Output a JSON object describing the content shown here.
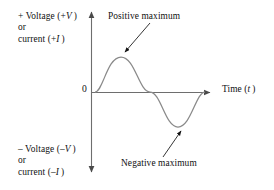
{
  "figure": {
    "type": "line-plot-sine-wave",
    "width": 274,
    "height": 190,
    "background_color": "#ffffff",
    "curve_color": "#8a8a8a",
    "axis_color": "#6e6e6e",
    "text_color": "#111111"
  },
  "axes": {
    "vertical": {
      "positive_label_line1": "+ Voltage (+V)",
      "positive_label_line2": "or",
      "positive_label_line3": "current (+I)",
      "negative_label_line1": "– Voltage (–V)",
      "negative_label_line2": "or",
      "negative_label_line3": "current (–I)",
      "arrow_up": true,
      "arrow_down": true
    },
    "horizontal": {
      "label": "Time (t)",
      "label_text": "Time",
      "label_symbol": "t",
      "arrow_right": true
    },
    "origin_label": "0"
  },
  "annotations": [
    {
      "id": "positive-maximum",
      "text": "Positive maximum",
      "target_x": 121,
      "target_y": 56
    },
    {
      "id": "negative-maximum",
      "text": "Negative maximum",
      "target_x": 178,
      "target_y": 127
    }
  ],
  "chart_data": {
    "type": "line",
    "title": "",
    "xlabel": "Time (t)",
    "ylabel": "+ Voltage (+V) or current (+I)",
    "grid": false,
    "legend": "none",
    "x": [
      0,
      0.125,
      0.25,
      0.375,
      0.5,
      0.625,
      0.75,
      0.875,
      1
    ],
    "series": [
      {
        "name": "Sinusoidal waveform",
        "values": [
          0,
          0.707,
          1,
          0.707,
          0,
          -0.707,
          -1,
          -0.707,
          0
        ]
      }
    ],
    "xlim": [
      0,
      1
    ],
    "ylim": [
      -1,
      1
    ],
    "annotations": [
      "Positive maximum",
      "Negative maximum"
    ]
  }
}
